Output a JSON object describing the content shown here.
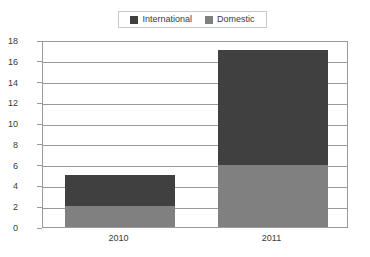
{
  "chart_data": {
    "type": "bar",
    "subtype": "stacked-bar",
    "title": "",
    "subtitle": "",
    "xlabel": "",
    "ylabel": "",
    "categories": [
      "2010",
      "2011"
    ],
    "series": [
      {
        "name": "Domestic",
        "values": [
          2,
          6
        ],
        "color": "#808080"
      },
      {
        "name": "International",
        "values": [
          3,
          11
        ],
        "color": "#404040"
      }
    ],
    "stack_totals": [
      5,
      17
    ],
    "ylim": [
      0,
      18
    ],
    "ytick_step": 2,
    "yticks": [
      0,
      2,
      4,
      6,
      8,
      10,
      12,
      14,
      16,
      18
    ],
    "ytick_labels": [
      "0",
      "2",
      "4",
      "6",
      "8",
      "10",
      "12",
      "14",
      "16",
      "18"
    ],
    "grid": true,
    "grid_axis": "y",
    "legend_position": "top-center",
    "legend_entries": [
      "International",
      "Domestic"
    ],
    "stack_order_bottom_to_top": [
      "Domestic",
      "International"
    ]
  },
  "legend": {
    "items": [
      {
        "label": "International",
        "swatch_name": "legend-swatch-international",
        "color": "#404040"
      },
      {
        "label": "Domestic",
        "swatch_name": "legend-swatch-domestic",
        "color": "#808080"
      }
    ]
  },
  "axes": {
    "y_labels": [
      "18",
      "16",
      "14",
      "12",
      "10",
      "8",
      "6",
      "4",
      "2",
      "0"
    ],
    "x_labels": [
      "2010",
      "2011"
    ]
  },
  "colors": {
    "international": "#404040",
    "domestic": "#808080",
    "gridline": "#9a9a9a",
    "frame": "#9a9a9a",
    "text": "#3a3a3a",
    "legend_border": "#c8c8c8",
    "background": "#ffffff"
  }
}
